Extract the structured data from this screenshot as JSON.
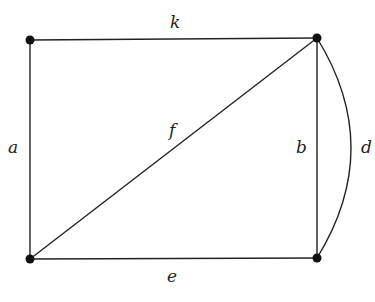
{
  "graph": {
    "vertices": [
      {
        "id": "v1",
        "x": 30,
        "y": 40
      },
      {
        "id": "v2",
        "x": 317,
        "y": 38
      },
      {
        "id": "v3",
        "x": 30,
        "y": 259
      },
      {
        "id": "v4",
        "x": 317,
        "y": 258
      }
    ],
    "edges": [
      {
        "label": "k",
        "from": "v1",
        "to": "v2"
      },
      {
        "label": "a",
        "from": "v1",
        "to": "v3"
      },
      {
        "label": "f",
        "from": "v3",
        "to": "v2"
      },
      {
        "label": "b",
        "from": "v2",
        "to": "v4"
      },
      {
        "label": "d",
        "from": "v2",
        "to": "v4",
        "curved": true
      },
      {
        "label": "e",
        "from": "v3",
        "to": "v4"
      }
    ]
  },
  "labels": {
    "k": "k",
    "a": "a",
    "f": "f",
    "b": "b",
    "d": "d",
    "e": "e"
  }
}
